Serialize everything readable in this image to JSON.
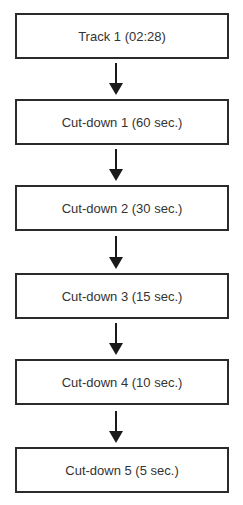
{
  "diagram": {
    "type": "flowchart",
    "direction": "top-to-bottom",
    "nodes": [
      {
        "id": "track-1",
        "label": "Track 1 (02:28)"
      },
      {
        "id": "cut-down-1",
        "label": "Cut-down 1 (60 sec.)"
      },
      {
        "id": "cut-down-2",
        "label": "Cut-down 2 (30 sec.)"
      },
      {
        "id": "cut-down-3",
        "label": "Cut-down 3 (15 sec.)"
      },
      {
        "id": "cut-down-4",
        "label": "Cut-down 4 (10 sec.)"
      },
      {
        "id": "cut-down-5",
        "label": "Cut-down 5 (5 sec.)"
      }
    ],
    "edges": [
      {
        "from": "track-1",
        "to": "cut-down-1"
      },
      {
        "from": "cut-down-1",
        "to": "cut-down-2"
      },
      {
        "from": "cut-down-2",
        "to": "cut-down-3"
      },
      {
        "from": "cut-down-3",
        "to": "cut-down-4"
      },
      {
        "from": "cut-down-4",
        "to": "cut-down-5"
      }
    ],
    "colors": {
      "border": "#2b2b2b",
      "text": "#333333",
      "arrow": "#1a1a1a",
      "background": "#ffffff"
    }
  }
}
